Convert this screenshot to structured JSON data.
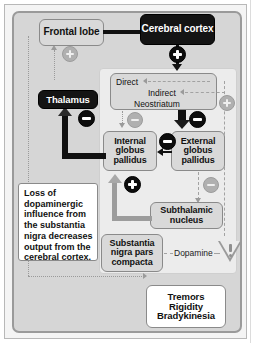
{
  "diagram": {
    "colors": {
      "panel_background": "#d6d6d6",
      "inner_panel_background": "#ececec",
      "node_light": "#d9d9d9",
      "node_dark": "#141414",
      "node_white": "#ffffff",
      "excitatory_badge": "#0d0d0d",
      "inhibited_badge": "#b0b0b0",
      "border": "#8a8a8a"
    },
    "nodes": {
      "frontal_lobe": "Frontal lobe",
      "cerebral_cortex": "Cerebral cortex",
      "thalamus": "Thalamus",
      "neostriatum": "Neostriatum",
      "direct": "Direct",
      "indirect": "Indirect",
      "internal_globus_pallidus": "Internal globus pallidus",
      "external_globus_pallidus": "External globus pallidus",
      "subthalamic_nucleus": "Subthalamic nucleus",
      "substantia_nigra": "Substantia nigra pars compacta",
      "symptoms": "Tremors Rigidity Bradykinesia",
      "symptom_lines": [
        "Tremors",
        "Rigidity",
        "Bradykinesia"
      ]
    },
    "labels": {
      "dopamine": "Dopamine",
      "info_note": "Loss of dopaminergic influence from the substantia nigra decreases output from the cerebral cortex."
    },
    "badges": {
      "plus": "+",
      "minus": "−",
      "cortex_to_neostriatum": "+",
      "thalamus_to_frontal_lobe": "+",
      "neostriatum_to_external_gp": "−",
      "neostriatum_to_internal_gp": "−",
      "external_gp_to_internal_gp": "−",
      "internal_gp_to_thalamus": "−",
      "subthalamic_to_internal_gp": "+",
      "indirect_right_plus": "+",
      "external_gp_to_subthalamic": "−"
    },
    "icons": {
      "warning_triangle": "decreased-dopamine-warning-icon"
    }
  }
}
